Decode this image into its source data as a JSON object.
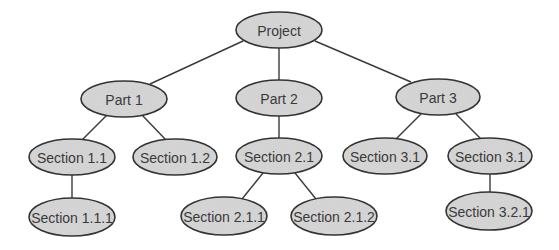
{
  "diagram": {
    "type": "tree",
    "colors": {
      "node_fill": "#cfcfcf",
      "node_stroke": "#333333",
      "edge": "#3a3a3a",
      "text": "#3a3a3a",
      "background": "#ffffff"
    },
    "nodes": [
      {
        "id": "project",
        "label": "Project",
        "cx": 279,
        "cy": 30,
        "rx": 43,
        "ry": 18
      },
      {
        "id": "part1",
        "label": "Part 1",
        "cx": 124,
        "cy": 99,
        "rx": 43,
        "ry": 18
      },
      {
        "id": "part2",
        "label": "Part 2",
        "cx": 279,
        "cy": 98,
        "rx": 43,
        "ry": 18
      },
      {
        "id": "part3",
        "label": "Part 3",
        "cx": 438,
        "cy": 97,
        "rx": 42,
        "ry": 18
      },
      {
        "id": "sec1_1",
        "label": "Section 1.1",
        "cx": 72,
        "cy": 157,
        "rx": 43,
        "ry": 18
      },
      {
        "id": "sec1_2",
        "label": "Section 1.2",
        "cx": 175,
        "cy": 157,
        "rx": 42,
        "ry": 18
      },
      {
        "id": "sec2_1",
        "label": "Section 2.1",
        "cx": 279,
        "cy": 156,
        "rx": 43,
        "ry": 18
      },
      {
        "id": "sec3_1a",
        "label": "Section 3.1",
        "cx": 385,
        "cy": 156,
        "rx": 42,
        "ry": 18
      },
      {
        "id": "sec3_1b",
        "label": "Section 3.1",
        "cx": 490,
        "cy": 156,
        "rx": 42,
        "ry": 18
      },
      {
        "id": "sec1_1_1",
        "label": "Section 1.1.1",
        "cx": 72,
        "cy": 217,
        "rx": 43,
        "ry": 19
      },
      {
        "id": "sec2_1_1",
        "label": "Section 2.1.1",
        "cx": 224,
        "cy": 216,
        "rx": 43,
        "ry": 19
      },
      {
        "id": "sec2_1_2",
        "label": "Section 2.1.2",
        "cx": 334,
        "cy": 216,
        "rx": 43,
        "ry": 19
      },
      {
        "id": "sec3_2_1",
        "label": "Section 3.2.1",
        "cx": 489,
        "cy": 211,
        "rx": 43,
        "ry": 19
      }
    ],
    "edges": [
      {
        "from": "project",
        "to": "part1",
        "x1": 243,
        "y1": 41,
        "x2": 150,
        "y2": 84
      },
      {
        "from": "project",
        "to": "part2",
        "x1": 279,
        "y1": 48,
        "x2": 279,
        "y2": 80
      },
      {
        "from": "project",
        "to": "part3",
        "x1": 315,
        "y1": 41,
        "x2": 411,
        "y2": 82
      },
      {
        "from": "part1",
        "to": "sec1_1",
        "x1": 107,
        "y1": 115,
        "x2": 82,
        "y2": 140
      },
      {
        "from": "part1",
        "to": "sec1_2",
        "x1": 142,
        "y1": 115,
        "x2": 166,
        "y2": 140
      },
      {
        "from": "part2",
        "to": "sec2_1",
        "x1": 279,
        "y1": 116,
        "x2": 279,
        "y2": 138
      },
      {
        "from": "part3",
        "to": "sec3_1a",
        "x1": 421,
        "y1": 114,
        "x2": 396,
        "y2": 139
      },
      {
        "from": "part3",
        "to": "sec3_1b",
        "x1": 456,
        "y1": 114,
        "x2": 481,
        "y2": 139
      },
      {
        "from": "sec1_1",
        "to": "sec1_1_1",
        "x1": 72,
        "y1": 175,
        "x2": 72,
        "y2": 198
      },
      {
        "from": "sec2_1",
        "to": "sec2_1_1",
        "x1": 263,
        "y1": 173,
        "x2": 242,
        "y2": 199
      },
      {
        "from": "sec2_1",
        "to": "sec2_1_2",
        "x1": 295,
        "y1": 173,
        "x2": 316,
        "y2": 199
      },
      {
        "from": "sec3_1b",
        "to": "sec3_2_1",
        "x1": 490,
        "y1": 174,
        "x2": 490,
        "y2": 192
      }
    ]
  }
}
